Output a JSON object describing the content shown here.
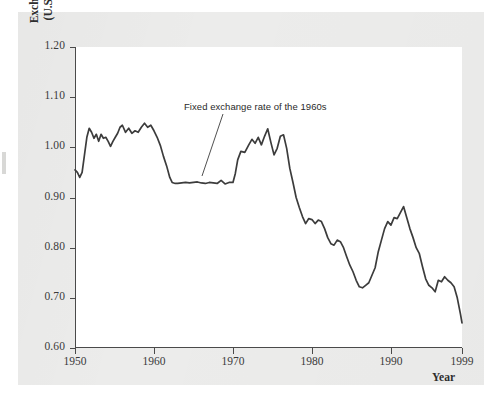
{
  "figure": {
    "background_color": "#ececeb",
    "plot_background_color": "#ffffff",
    "line_color": "#3c3c3c",
    "axis_color": "#4a4a4a"
  },
  "axes": {
    "ylabel_line1": "Exchange rate",
    "ylabel_line2": "(U.S. dollars)",
    "xlabel": "Year",
    "yticks": [
      "1.20",
      "1.10",
      "1.00",
      "0.90",
      "0.80",
      "0.70",
      "0.60"
    ],
    "xticks": [
      "1950",
      "1960",
      "1970",
      "1980",
      "1990",
      "1999"
    ]
  },
  "annotations": [
    {
      "text": "Fixed exchange rate of the 1960s"
    }
  ],
  "chart_data": {
    "type": "line",
    "title": "",
    "xlabel": "Year",
    "ylabel": "Exchange rate (U.S. dollars)",
    "xlim": [
      1950,
      1999
    ],
    "ylim": [
      0.6,
      1.2
    ],
    "yticks": [
      0.6,
      0.7,
      0.8,
      0.9,
      1.0,
      1.1,
      1.2
    ],
    "xticks": [
      1950,
      1960,
      1970,
      1980,
      1990,
      1999
    ],
    "grid": false,
    "legend": "none",
    "annotations": [
      {
        "text": "Fixed exchange rate of the 1960s",
        "text_x": 1963.4,
        "text_y": 1.107,
        "points_to_x": 1965.6,
        "points_to_y": 0.938
      }
    ],
    "series": [
      {
        "name": "Canadian dollar exchange rate",
        "x": [
          1950.0,
          1950.3,
          1950.6,
          1950.9,
          1951.2,
          1951.5,
          1951.8,
          1952.1,
          1952.4,
          1952.7,
          1953.0,
          1953.3,
          1953.6,
          1953.9,
          1954.2,
          1954.5,
          1954.8,
          1955.1,
          1955.4,
          1955.7,
          1956.0,
          1956.4,
          1956.8,
          1957.2,
          1957.6,
          1958.0,
          1958.4,
          1958.8,
          1959.2,
          1959.6,
          1960.0,
          1960.4,
          1960.8,
          1961.2,
          1961.6,
          1962.0,
          1962.3,
          1962.7,
          1963.0,
          1963.5,
          1964.0,
          1964.5,
          1965.0,
          1965.5,
          1966.0,
          1966.5,
          1967.0,
          1967.5,
          1968.0,
          1968.5,
          1969.0,
          1969.5,
          1970.0,
          1970.3,
          1970.6,
          1971.0,
          1971.5,
          1972.0,
          1972.4,
          1972.8,
          1973.2,
          1973.6,
          1974.0,
          1974.4,
          1974.8,
          1975.2,
          1975.6,
          1976.0,
          1976.4,
          1976.8,
          1977.2,
          1977.6,
          1978.0,
          1978.4,
          1978.8,
          1979.2,
          1979.6,
          1980.0,
          1980.4,
          1980.8,
          1981.2,
          1981.6,
          1982.0,
          1982.4,
          1982.8,
          1983.2,
          1983.6,
          1984.0,
          1984.4,
          1984.8,
          1985.2,
          1985.6,
          1986.0,
          1986.4,
          1986.8,
          1987.2,
          1987.6,
          1988.0,
          1988.4,
          1988.8,
          1989.2,
          1989.6,
          1990.0,
          1990.4,
          1990.8,
          1991.2,
          1991.6,
          1992.0,
          1992.4,
          1992.8,
          1993.2,
          1993.6,
          1994.0,
          1994.4,
          1994.8,
          1995.2,
          1995.6,
          1996.0,
          1996.4,
          1996.8,
          1997.2,
          1997.6,
          1998.0,
          1998.4,
          1998.8,
          1999.0
        ],
        "y": [
          0.955,
          0.95,
          0.94,
          0.95,
          0.985,
          1.02,
          1.038,
          1.03,
          1.018,
          1.026,
          1.012,
          1.026,
          1.018,
          1.02,
          1.012,
          1.002,
          1.012,
          1.02,
          1.028,
          1.04,
          1.044,
          1.03,
          1.038,
          1.028,
          1.033,
          1.03,
          1.04,
          1.048,
          1.04,
          1.044,
          1.033,
          1.02,
          1.004,
          0.982,
          0.963,
          0.94,
          0.93,
          0.928,
          0.928,
          0.929,
          0.93,
          0.929,
          0.93,
          0.931,
          0.929,
          0.928,
          0.93,
          0.929,
          0.928,
          0.934,
          0.927,
          0.93,
          0.93,
          0.948,
          0.975,
          0.992,
          0.99,
          1.005,
          1.016,
          1.008,
          1.02,
          1.005,
          1.022,
          1.037,
          1.01,
          0.985,
          0.998,
          1.022,
          1.025,
          0.998,
          0.958,
          0.93,
          0.9,
          0.88,
          0.862,
          0.848,
          0.858,
          0.856,
          0.848,
          0.855,
          0.852,
          0.838,
          0.82,
          0.808,
          0.805,
          0.815,
          0.812,
          0.8,
          0.782,
          0.765,
          0.752,
          0.735,
          0.722,
          0.72,
          0.725,
          0.73,
          0.745,
          0.76,
          0.792,
          0.815,
          0.838,
          0.852,
          0.845,
          0.86,
          0.858,
          0.87,
          0.882,
          0.86,
          0.838,
          0.82,
          0.8,
          0.788,
          0.762,
          0.738,
          0.725,
          0.72,
          0.712,
          0.735,
          0.732,
          0.742,
          0.735,
          0.73,
          0.722,
          0.7,
          0.668,
          0.65
        ]
      }
    ]
  }
}
